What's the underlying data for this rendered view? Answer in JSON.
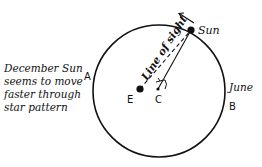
{
  "diagram": {
    "labels": {
      "sun": "Sun",
      "line_of_sight": "Line of sight",
      "earth": "E",
      "center": "C",
      "point_a": "A",
      "point_b": "B",
      "june": "June"
    },
    "caption": {
      "lines": [
        "December Sun",
        "seems to move",
        "faster through",
        "star pattern"
      ]
    },
    "colors": {
      "stroke": "#111111",
      "background": "#ffffff"
    }
  }
}
